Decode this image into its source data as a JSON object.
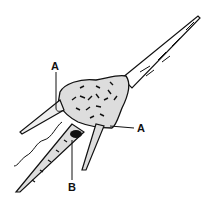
{
  "diagram": {
    "labels": [
      {
        "id": "label-a-upper",
        "text": "A"
      },
      {
        "id": "label-a-right",
        "text": "A"
      },
      {
        "id": "label-b",
        "text": "B"
      }
    ],
    "colors": {
      "ink": "#111111",
      "background": "#ffffff"
    }
  }
}
